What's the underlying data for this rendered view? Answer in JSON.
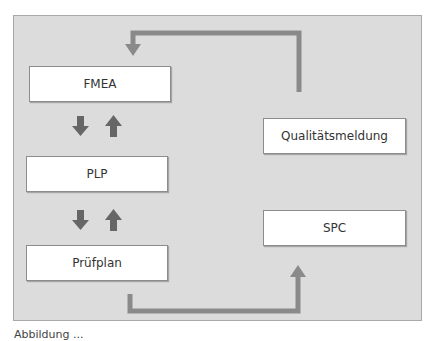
{
  "diagram": {
    "boxes": {
      "fmea": "FMEA",
      "plp": "PLP",
      "pruefplan": "Prüfplan",
      "qualitaetsmeldung": "Qualitätsmeldung",
      "spc": "SPC"
    },
    "colors": {
      "panel_background": "#dcdcdc",
      "box_background": "#ffffff",
      "arrow_color": "#8a8a8a",
      "small_arrow_color": "#666666"
    },
    "caption": "Abbildung ..."
  }
}
